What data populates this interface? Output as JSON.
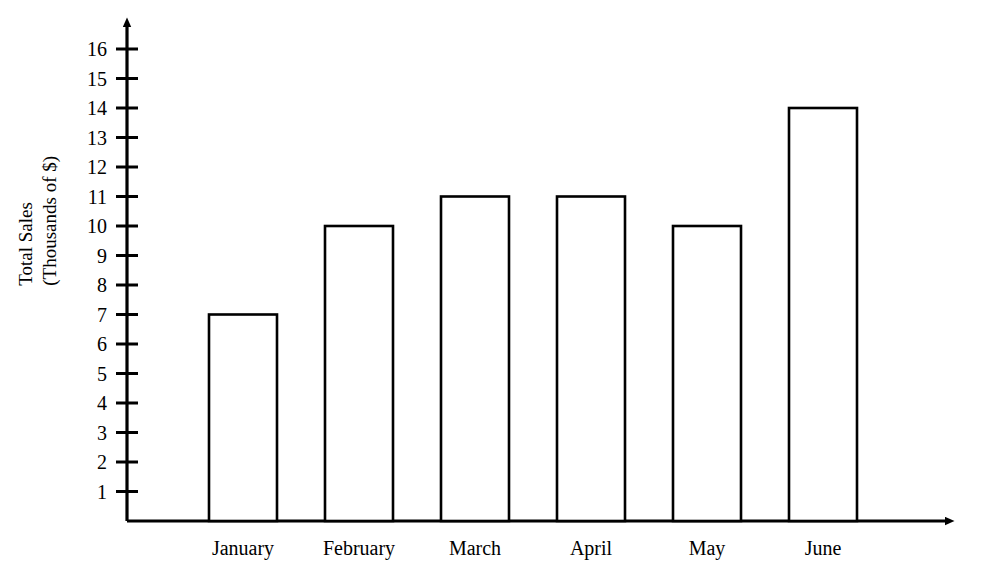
{
  "chart_data": {
    "type": "bar",
    "title": "",
    "xlabel": "",
    "ylabel": "Total Sales\n(Thousands of $)",
    "ylabel_lines": [
      "Total Sales",
      "(Thousands of $)"
    ],
    "categories": [
      "January",
      "February",
      "March",
      "April",
      "May",
      "June"
    ],
    "values": [
      7,
      10,
      11,
      11,
      10,
      14
    ],
    "series": [
      {
        "name": "Total Sales",
        "values": [
          7,
          10,
          11,
          11,
          10,
          14
        ]
      }
    ],
    "ylim": [
      0,
      16.5
    ],
    "ytick_values": [
      1,
      2,
      3,
      4,
      5,
      6,
      7,
      8,
      9,
      10,
      11,
      12,
      13,
      14,
      15,
      16
    ],
    "ytick_labels": [
      "1",
      "2",
      "3",
      "4",
      "5",
      "6",
      "7",
      "8",
      "9",
      "10",
      "11",
      "12",
      "13",
      "14",
      "15",
      "16"
    ],
    "grid": false,
    "legend": false,
    "legend_position": "none",
    "bar_fill_color": "#ffffff",
    "bar_edge_color": "#000000",
    "axis_color": "#000000",
    "background_color": "#ffffff",
    "axis_arrow_x": true,
    "axis_arrow_y": true,
    "units": "Thousands of $"
  }
}
